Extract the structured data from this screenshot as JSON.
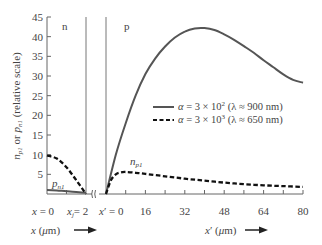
{
  "chart_data": {
    "type": "line",
    "title": "",
    "ylabel": "n_p1 or p_n1 (relative scale)",
    "ylim": [
      0,
      45
    ],
    "yticks": [
      5,
      10,
      15,
      20,
      25,
      30,
      35,
      40,
      45
    ],
    "regions": {
      "n": {
        "label": "n",
        "xlabel": "x (µm) →",
        "xlim": [
          0,
          2
        ],
        "tick_labels": [
          "x = 0",
          "x_j = 2"
        ]
      },
      "p": {
        "label": "p",
        "xlabel": "x′ (µm) →",
        "xlim": [
          0,
          80
        ],
        "xticks": [
          0,
          8,
          16,
          24,
          32,
          40,
          48,
          56,
          64,
          72,
          80
        ],
        "tick_labels": [
          "x′ = 0",
          "16",
          "32",
          "48",
          "64",
          "80"
        ]
      }
    },
    "series": [
      {
        "name": "α = 3 × 10² (λ ≈ 900 nm)",
        "style": "solid",
        "n_region": {
          "label": "p_n1",
          "x": [
            0,
            0.5,
            1,
            1.5,
            2
          ],
          "values": [
            1.0,
            0.9,
            0.7,
            0.5,
            0.3
          ]
        },
        "p_region": {
          "x": [
            0,
            4,
            8,
            12,
            16,
            20,
            24,
            28,
            32,
            36,
            40,
            44,
            48,
            52,
            56,
            60,
            64,
            68,
            72,
            76,
            80
          ],
          "values": [
            0,
            10,
            18,
            25,
            30.5,
            34.5,
            37.5,
            39.8,
            41.3,
            42.1,
            42.2,
            41.7,
            40.6,
            39.2,
            37.6,
            35.9,
            34.0,
            32.2,
            30.4,
            29.0,
            28.3
          ]
        }
      },
      {
        "name": "α = 3 × 10³ (λ ≈ 650 nm)",
        "style": "dashed",
        "n_region": {
          "label": "p_n1",
          "x": [
            0,
            0.5,
            1,
            1.5,
            2
          ],
          "values": [
            9.8,
            9.0,
            6.8,
            3.5,
            0
          ]
        },
        "p_region": {
          "label": "n_p1",
          "x": [
            0,
            2,
            4,
            6,
            8,
            12,
            16,
            24,
            32,
            40,
            48,
            56,
            64,
            72,
            80
          ],
          "values": [
            0,
            3.5,
            5.0,
            5.5,
            5.6,
            5.4,
            5.1,
            4.5,
            3.9,
            3.4,
            2.9,
            2.5,
            2.2,
            2.0,
            1.8
          ]
        }
      }
    ],
    "legend": {
      "position": "right-middle",
      "entries": [
        {
          "style": "solid",
          "text": "α = 3 × 10² (λ ≈ 900 nm)"
        },
        {
          "style": "dashed",
          "text": "α = 3 × 10³ (λ ≈ 650 nm)"
        }
      ]
    },
    "annotations": [
      "n",
      "p",
      "p_n1",
      "n_p1"
    ],
    "grid": false
  },
  "labels": {
    "ylabel": "n_p1 or p_n1 (relative scale)",
    "region_n": "n",
    "region_p": "p",
    "pn1": "p",
    "pn1_sub": "n1",
    "np1": "n",
    "np1_sub": "p1",
    "x_label": "x (µm)",
    "xp_label": "x′ (µm)",
    "x0": "x = 0",
    "xj": "= 2",
    "xp0": "x′ = 0",
    "legend_solid": "α = 3 × 10² (λ ≈ 900 nm)",
    "legend_dashed": "α = 3 × 10³ (λ ≈ 650 nm)"
  },
  "colors": {
    "solid_curve": "#555555",
    "dashed_curve": "#111111",
    "axis": "#666666",
    "text": "#444444"
  }
}
